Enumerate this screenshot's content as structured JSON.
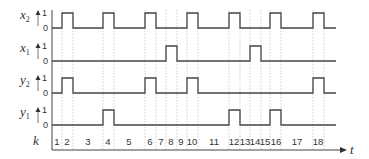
{
  "diagram": {
    "type": "timing",
    "signals": [
      {
        "name": "x",
        "sub": "2",
        "baseline": 28,
        "pulses_k": [
          2,
          6,
          10,
          12,
          16,
          18,
          22
        ]
      },
      {
        "name": "x",
        "sub": "1",
        "baseline": 61
      },
      {
        "name": "y",
        "sub": "2",
        "baseline": 93
      },
      {
        "name": "y",
        "sub": "1",
        "baseline": 125
      }
    ],
    "level_high": "1",
    "level_low": "0",
    "k_label": "k",
    "t_label": "t",
    "k_ticks": [
      "1",
      "2",
      "3",
      "4",
      "5",
      "6",
      "7",
      "8",
      "9",
      "10",
      "11",
      "12",
      "13",
      "14",
      "15",
      "16",
      "17",
      "18"
    ],
    "x2_pulses": [
      [
        62,
        73
      ],
      [
        103,
        114
      ],
      [
        145,
        156
      ],
      [
        187,
        198
      ],
      [
        229,
        240
      ],
      [
        270,
        281
      ],
      [
        313,
        324
      ]
    ],
    "x1_pulses": [
      [
        166,
        177
      ],
      [
        250,
        261
      ]
    ],
    "y2_pulses": [
      [
        62,
        73
      ],
      [
        145,
        156
      ],
      [
        187,
        198
      ],
      [
        313,
        324
      ]
    ],
    "y1_pulses": [
      [
        103,
        114
      ],
      [
        229,
        240
      ],
      [
        270,
        281
      ]
    ],
    "colors": {
      "line": "#444444",
      "grid": "#bbbbbb",
      "text": "#333333"
    }
  }
}
